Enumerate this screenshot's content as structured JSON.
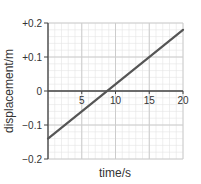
{
  "chart_data": {
    "type": "line",
    "title": "",
    "xlabel": "time/s",
    "ylabel": "displacement/m",
    "xlim": [
      0,
      20
    ],
    "ylim": [
      -0.2,
      0.2
    ],
    "x_ticks": [
      5,
      10,
      15,
      20
    ],
    "x_tick_labels": [
      "5",
      "10",
      "15",
      "20"
    ],
    "y_ticks": [
      0.2,
      0.1,
      0,
      -0.1,
      -0.2
    ],
    "y_tick_labels": [
      "+0.2",
      "+0.1",
      "0",
      "−0.1",
      "−0.2"
    ],
    "grid": true,
    "grid_minor": {
      "x_step": 1,
      "y_step": 0.02
    },
    "grid_major": {
      "x_step": 5,
      "y_step": 0.1
    },
    "series": [
      {
        "name": "displacement",
        "x": [
          0,
          20
        ],
        "y": [
          -0.14,
          0.18
        ],
        "color": "#555555"
      }
    ],
    "annotations": [],
    "legend": null
  },
  "colors": {
    "line": "#555555",
    "axis": "#444444",
    "grid_minor": "#e4e4e4",
    "grid_major": "#cccccc"
  }
}
